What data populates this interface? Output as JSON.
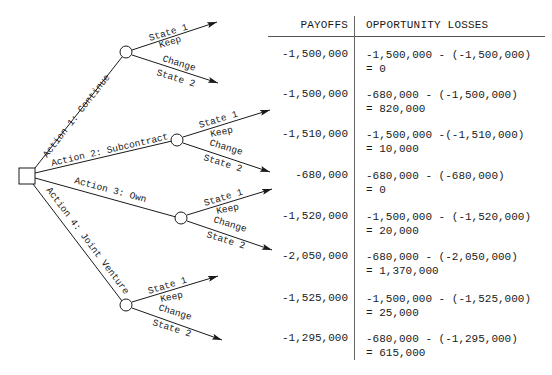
{
  "header": {
    "payoffs": "PAYOFFS",
    "opportunity_losses": "OPPORTUNITY LOSSES"
  },
  "decision_node": {
    "shape": "square"
  },
  "actions": [
    {
      "label": "Action 1: Continue",
      "outcomes": [
        {
          "state": "State 1",
          "sub": "Keep",
          "payoff": "-1,500,000",
          "loss_expr": "-1,500,000 - (-1,500,000)",
          "loss_result": "= 0"
        },
        {
          "state": "State 2",
          "sub": "Change",
          "payoff": "-1,500,000",
          "loss_expr": "-680,000 - (-1,500,000)",
          "loss_result": "= 820,000"
        }
      ]
    },
    {
      "label": "Action 2: Subcontract",
      "outcomes": [
        {
          "state": "State 1",
          "sub": "Keep",
          "payoff": "-1,510,000",
          "loss_expr": "-1,500,000 -(-1,510,000)",
          "loss_result": "= 10,000"
        },
        {
          "state": "State 2",
          "sub": "Change",
          "payoff": "-680,000",
          "loss_expr": "-680,000 - (-680,000)",
          "loss_result": "= 0"
        }
      ]
    },
    {
      "label": "Action 3: Own",
      "outcomes": [
        {
          "state": "State 1",
          "sub": "Keep",
          "payoff": "-1,520,000",
          "loss_expr": "-1,500,000 - (-1,520,000)",
          "loss_result": "= 20,000"
        },
        {
          "state": "State 2",
          "sub": "Change",
          "payoff": "-2,050,000",
          "loss_expr": "-680,000 - (-2,050,000)",
          "loss_result": "= 1,370,000"
        }
      ]
    },
    {
      "label": "Action 4: Joint Venture",
      "outcomes": [
        {
          "state": "State 1",
          "sub": "Keep",
          "payoff": "-1,525,000",
          "loss_expr": "-1,500,000 - (-1,525,000)",
          "loss_result": "= 25,000"
        },
        {
          "state": "State 2",
          "sub": "Change",
          "payoff": "-1,295,000",
          "loss_expr": "-680,000 - (-1,295,000)",
          "loss_result": "= 615,000"
        }
      ]
    }
  ]
}
